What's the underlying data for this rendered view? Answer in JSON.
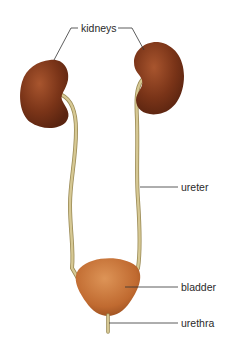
{
  "diagram": {
    "labels": {
      "kidneys": "kidneys",
      "ureter": "ureter",
      "bladder": "bladder",
      "urethra": "urethra"
    },
    "colors": {
      "kidney": "#7a3418",
      "kidney_highlight": "#a8552e",
      "bladder": "#c9743a",
      "bladder_highlight": "#dd9457",
      "ureter": "#cfc08a",
      "ureter_edge": "#9a8a55",
      "leader_line": "#333333",
      "background": "#ffffff"
    }
  }
}
